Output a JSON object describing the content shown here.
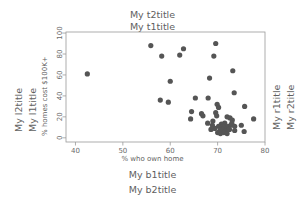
{
  "titles": {
    "top_outer": "My t2title",
    "top_inner": "My t1title",
    "bottom_inner": "My b1title",
    "bottom_outer": "My b2title",
    "left_outer": "My l2title",
    "left_inner": "My l1title",
    "right_inner": "My r1title",
    "right_outer": "My r2title"
  },
  "style": {
    "point_color": "#555555",
    "frame_color": "#9a9a9a",
    "text_color": "#5f5f5f",
    "background": "#ffffff"
  },
  "chart_data": {
    "type": "scatter",
    "title": "My t1title",
    "xlabel": "% who own home",
    "ylabel": "% homes cost $100K+",
    "xlim": [
      38,
      80
    ],
    "ylim": [
      -4,
      101
    ],
    "xticks": [
      40,
      50,
      60,
      70,
      80
    ],
    "yticks": [
      0,
      20,
      40,
      60,
      80,
      100
    ],
    "grid": false,
    "legend": "none",
    "marker": "filled-circle",
    "points": [
      {
        "x": 42.5,
        "y": 61
      },
      {
        "x": 55.9,
        "y": 88
      },
      {
        "x": 58.2,
        "y": 78
      },
      {
        "x": 62.0,
        "y": 79
      },
      {
        "x": 62.8,
        "y": 85
      },
      {
        "x": 69.6,
        "y": 90
      },
      {
        "x": 69.2,
        "y": 78
      },
      {
        "x": 73.2,
        "y": 64
      },
      {
        "x": 68.3,
        "y": 57
      },
      {
        "x": 60.0,
        "y": 54
      },
      {
        "x": 73.5,
        "y": 43
      },
      {
        "x": 57.9,
        "y": 36
      },
      {
        "x": 59.6,
        "y": 34
      },
      {
        "x": 65.3,
        "y": 38
      },
      {
        "x": 68.0,
        "y": 38
      },
      {
        "x": 69.9,
        "y": 32
      },
      {
        "x": 70.2,
        "y": 29
      },
      {
        "x": 75.7,
        "y": 30
      },
      {
        "x": 64.5,
        "y": 25
      },
      {
        "x": 66.6,
        "y": 23
      },
      {
        "x": 66.9,
        "y": 21
      },
      {
        "x": 64.3,
        "y": 18
      },
      {
        "x": 69.6,
        "y": 24
      },
      {
        "x": 69.8,
        "y": 21
      },
      {
        "x": 72.0,
        "y": 20
      },
      {
        "x": 72.6,
        "y": 19
      },
      {
        "x": 73.1,
        "y": 17
      },
      {
        "x": 77.6,
        "y": 18
      },
      {
        "x": 75.0,
        "y": 12
      },
      {
        "x": 75.6,
        "y": 6
      },
      {
        "x": 73.6,
        "y": 7
      },
      {
        "x": 71.5,
        "y": 14
      },
      {
        "x": 70.8,
        "y": 13
      },
      {
        "x": 70.2,
        "y": 11
      },
      {
        "x": 70.9,
        "y": 10
      },
      {
        "x": 71.6,
        "y": 10
      },
      {
        "x": 72.3,
        "y": 11
      },
      {
        "x": 72.8,
        "y": 12
      },
      {
        "x": 71.1,
        "y": 8
      },
      {
        "x": 71.8,
        "y": 7
      },
      {
        "x": 72.5,
        "y": 8
      },
      {
        "x": 70.5,
        "y": 7
      },
      {
        "x": 70.0,
        "y": 5
      },
      {
        "x": 70.6,
        "y": 4
      },
      {
        "x": 71.3,
        "y": 5
      },
      {
        "x": 72.0,
        "y": 4
      },
      {
        "x": 69.4,
        "y": 9
      },
      {
        "x": 68.9,
        "y": 12
      },
      {
        "x": 68.6,
        "y": 8
      },
      {
        "x": 67.9,
        "y": 14
      },
      {
        "x": 73.0,
        "y": 14
      },
      {
        "x": 73.6,
        "y": 11
      },
      {
        "x": 69.0,
        "y": 16
      }
    ]
  }
}
